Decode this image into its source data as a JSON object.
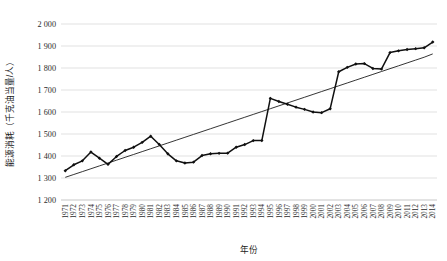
{
  "chart_data": {
    "type": "line",
    "title": "",
    "subtitle": "",
    "xlabel": "年份",
    "ylabel": "能源消耗（千克油当量/人）",
    "ylim": [
      1200,
      2000
    ],
    "ytick_step": 100,
    "ytick_labels": [
      "1 200",
      "1 300",
      "1 400",
      "1 500",
      "1 600",
      "1 700",
      "1 800",
      "1 900",
      "2 000"
    ],
    "ytick_values": [
      1200,
      1300,
      1400,
      1500,
      1600,
      1700,
      1800,
      1900,
      2000
    ],
    "grid": true,
    "legend": "none",
    "categories": [
      "1971",
      "1972",
      "1973",
      "1974",
      "1975",
      "1976",
      "1977",
      "1978",
      "1979",
      "1980",
      "1981",
      "1982",
      "1983",
      "1984",
      "1985",
      "1986",
      "1987",
      "1988",
      "1989",
      "1990",
      "1991",
      "1992",
      "1993",
      "1994",
      "1995",
      "1996",
      "1997",
      "1998",
      "1999",
      "2000",
      "2001",
      "2002",
      "2003",
      "2004",
      "2005",
      "2006",
      "2007",
      "2008",
      "2009",
      "2010",
      "2011",
      "2012",
      "2013",
      "2014"
    ],
    "series": [
      {
        "name": "能源消耗",
        "marker": "diamond",
        "color": "#101010",
        "values": [
          1333,
          1360,
          1378,
          1418,
          1390,
          1362,
          1398,
          1425,
          1440,
          1462,
          1490,
          1452,
          1410,
          1378,
          1368,
          1372,
          1402,
          1410,
          1412,
          1413,
          1440,
          1452,
          1470,
          1470,
          1662,
          1648,
          1635,
          1622,
          1612,
          1600,
          1597,
          1615,
          1622,
          1620,
          1606,
          1613,
          1622,
          1632,
          1636,
          1630,
          1633,
          1643,
          1688,
          1740
        ]
      },
      {
        "name": "线性趋势线",
        "marker": "none",
        "color": "#101010",
        "values": [
          1303,
          1316,
          1329,
          1342,
          1355,
          1368,
          1381,
          1394,
          1407,
          1420,
          1433,
          1446,
          1459,
          1472,
          1485,
          1498,
          1511,
          1524,
          1537,
          1550,
          1563,
          1576,
          1589,
          1602,
          1615,
          1628,
          1641,
          1654,
          1667,
          1680,
          1693,
          1706,
          1719,
          1732,
          1745,
          1758,
          1771,
          1784,
          1797,
          1810,
          1823,
          1836,
          1849,
          1864
        ]
      }
    ],
    "series_extended_values": [
      1783,
      1803,
      1818,
      1820,
      1798,
      1795,
      1870,
      1878,
      1884,
      1888,
      1892,
      1918
    ]
  },
  "axes": {
    "x_axis_name": "年份",
    "y_axis_name": "能源消耗（千克油当量/人）"
  }
}
